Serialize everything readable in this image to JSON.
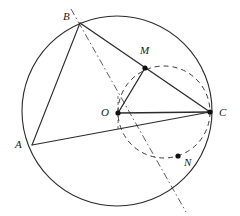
{
  "figure": {
    "canvas": {
      "width": 240,
      "height": 216
    },
    "stroke_color": "#2b2b2b",
    "dash_color": "#3a3a3a",
    "background": "#ffffff"
  },
  "points": [
    {
      "id": "A",
      "label": "A",
      "x": 32,
      "y": 145,
      "label_x": 15,
      "label_y": 139,
      "dot": false
    },
    {
      "id": "B",
      "label": "B",
      "x": 80,
      "y": 23,
      "label_x": 63,
      "label_y": 11,
      "dot": false
    },
    {
      "id": "C",
      "label": "C",
      "x": 210,
      "y": 112,
      "label_x": 219,
      "label_y": 107,
      "dot": true
    },
    {
      "id": "M",
      "label": "M",
      "x": 145,
      "y": 68,
      "label_x": 140,
      "label_y": 45,
      "dot": true
    },
    {
      "id": "N",
      "label": "N",
      "x": 178,
      "y": 156,
      "label_x": 184,
      "label_y": 157,
      "dot": true
    },
    {
      "id": "O",
      "label": "O",
      "x": 118,
      "y": 113,
      "label_x": 101,
      "label_y": 107,
      "dot": true
    }
  ],
  "circles": [
    {
      "id": "outer-circle",
      "name": "circumcircle-O",
      "cx": 117,
      "cy": 111,
      "r": 95,
      "style": "solid",
      "stroke_width": 1.1
    },
    {
      "id": "inner-circle",
      "name": "dashed-circle-through-M-C-N",
      "cx": 164,
      "cy": 112,
      "r": 46,
      "style": "dashed",
      "stroke_width": 1.0,
      "dash_pattern": "5,4"
    }
  ],
  "segments": [
    {
      "id": "seg-AB",
      "from": "A",
      "to": "B",
      "style": "solid",
      "stroke_width": 1.1
    },
    {
      "id": "seg-BM",
      "from": "B",
      "to": "M",
      "style": "solid",
      "stroke_width": 1.3
    },
    {
      "id": "seg-MC",
      "from": "M",
      "to": "C",
      "style": "solid",
      "stroke_width": 1.3
    },
    {
      "id": "seg-AC",
      "from": "A",
      "to": "C",
      "style": "solid",
      "stroke_width": 1.1
    },
    {
      "id": "seg-OM",
      "from": "O",
      "to": "M",
      "style": "solid",
      "stroke_width": 1.3
    },
    {
      "id": "seg-OC",
      "from": "O",
      "to": "C",
      "style": "solid",
      "stroke_width": 1.3
    }
  ],
  "dash_dot_lines": [
    {
      "id": "line-B-M-N-extended",
      "name": "axis-line-through-M-and-N",
      "x1": 71,
      "y1": 9,
      "x2": 186,
      "y2": 212,
      "dash_pattern": "7,3,1.5,3",
      "stroke_width": 0.9
    },
    {
      "id": "line-O-N-vertical",
      "name": "vertical-dashed-through-O",
      "x1": 118,
      "y1": 97,
      "x2": 118,
      "y2": 130,
      "dash_pattern": "3,3",
      "stroke_width": 0.8
    }
  ],
  "accessibility": {
    "alt": "Geometric figure: large solid circle centered at O with inscribed triangle A B C; points M on chord BC and N below; a smaller dashed circle passes through M, C and N; a dash-dot line runs from above B through M and N to the lower right."
  }
}
